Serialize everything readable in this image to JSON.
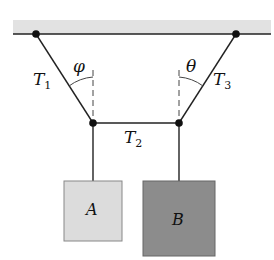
{
  "diagram": {
    "type": "physics-free-body",
    "ceiling": {
      "color": "#e2e2e2",
      "line_color": "#222222"
    },
    "labels": {
      "t1_main": "T",
      "t1_sub": "1",
      "t2_main": "T",
      "t2_sub": "2",
      "t3_main": "T",
      "t3_sub": "3",
      "phi": "φ",
      "theta": "θ",
      "block_a": "A",
      "block_b": "B"
    },
    "colors": {
      "block_a_fill": "#dcdcdc",
      "block_b_fill": "#8c8c8c",
      "block_border": "#777777",
      "rope": "#222222"
    }
  }
}
